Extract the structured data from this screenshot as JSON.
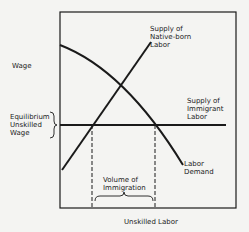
{
  "diagram": {
    "y_axis_label": "Wage",
    "x_axis_label": "Unskilled Labor",
    "equilibrium_label": "Equilibrium\nUnskilled\nWage",
    "curves": [
      {
        "id": "native-supply",
        "label": "Supply of\nNative-born\nLabor",
        "shape": "upward-sloping line"
      },
      {
        "id": "immigrant-supply",
        "label": "Supply of\nImmigrant\nLabor",
        "shape": "horizontal line at equilibrium wage"
      },
      {
        "id": "labor-demand",
        "label": "Labor\nDemand",
        "shape": "downward-sloping concave curve"
      }
    ],
    "bracket_label": "Volume of\nImmigration",
    "colors": {
      "ink": "#1a1a1a",
      "background": "#f4f4f2"
    }
  }
}
